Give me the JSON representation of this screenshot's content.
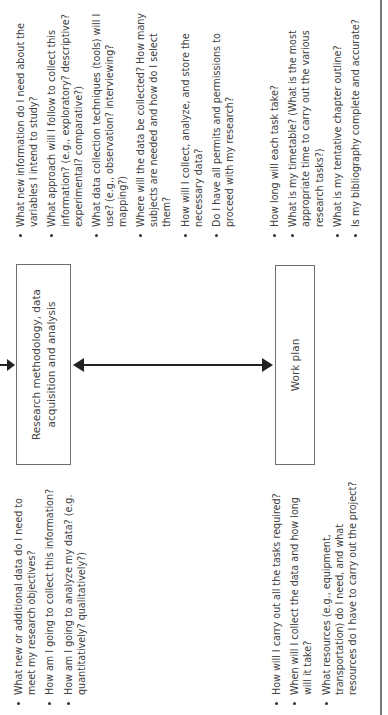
{
  "diagram": {
    "orientation": "rotated-90-ccw",
    "boxes": {
      "research": {
        "label": "Research methodology, data acquisition and analysis"
      },
      "workplan": {
        "label": "Work plan"
      }
    },
    "connectors": [
      {
        "from": "above",
        "to": "research",
        "type": "arrow"
      },
      {
        "from": "research",
        "to": "workplan",
        "type": "double-arrow"
      }
    ],
    "research_questions_left": [
      "What new information do I need about the variables I intend to study?",
      "What approach will I follow to collect this information? (e.g., exploratory? descriptive? experimental? comparative?)",
      "What data collection techniques (tools) will I use? (e.g., observation? interviewing? mapping?)"
    ],
    "research_questions_right": [
      "Where will the data be collected? How many subjects are needed and how do I select them?",
      "How will I collect, analyze, and store the necessary data?",
      "Do I have all permits and permissions to proceed with my research?"
    ],
    "research_questions_early": [
      "What new or additional data do I need to meet my research objectives?",
      "How am I going to collect this information?",
      "How am I going to analyze my data? (e.g. quantitatively? qualitatively?)"
    ],
    "workplan_questions_late": [
      "How long will each task take?",
      "What is my timetable? (What is the most appropriate time to carry out the various research tasks?)",
      "What is my tentative chapter outline?",
      "Is my bibliography complete and accurate?"
    ],
    "workplan_questions_early": [
      "How will I carry out all the tasks required?",
      "When will I collect the data and how long will it take?",
      "What resources (e.g., equipment, transportation) do I need, and what resources do I have to carry out the project?"
    ]
  }
}
